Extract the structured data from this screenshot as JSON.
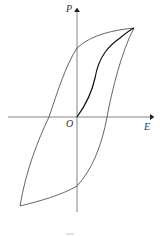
{
  "diagram": {
    "type": "hysteresis-loop",
    "axes": {
      "y_label": "P",
      "x_label": "E",
      "origin_label": "O"
    },
    "curves": [
      {
        "name": "outer-hysteresis-loop",
        "color": "#555555"
      },
      {
        "name": "initial-polarization-curve",
        "color": "#111111"
      }
    ]
  }
}
